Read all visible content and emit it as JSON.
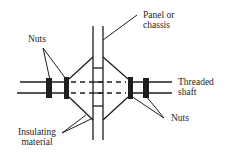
{
  "diagram": {
    "colors": {
      "stroke": "#1e1e1e",
      "nut_fill": "#1e1e1e",
      "background": "#ffffff"
    },
    "labels": {
      "panel": [
        "Panel or",
        "chassis"
      ],
      "nuts_left": "Nuts",
      "nuts_right": "Nuts",
      "shaft": [
        "Threaded",
        "shaft"
      ],
      "insulating": [
        "Insulating",
        "material"
      ]
    },
    "components": [
      {
        "id": "panel",
        "label": "Panel or chassis"
      },
      {
        "id": "threaded-shaft",
        "label": "Threaded shaft"
      },
      {
        "id": "nuts-left",
        "label": "Nuts",
        "count": 2
      },
      {
        "id": "nuts-right",
        "label": "Nuts",
        "count": 2
      },
      {
        "id": "insulating-material",
        "label": "Insulating material",
        "count": 2
      }
    ]
  }
}
